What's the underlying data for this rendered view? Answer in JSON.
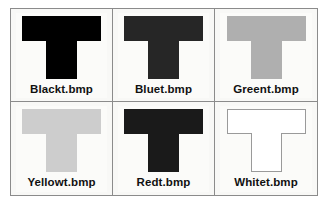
{
  "figure": {
    "background": "#ffffff",
    "frame_color": "#8b8b8b",
    "panel_background": "#fbfbf9",
    "label_color": "#111111",
    "columns": 3,
    "rows": 2
  },
  "panels": [
    {
      "label": "Blackt.bmp",
      "shape": "T",
      "fill": "#000000",
      "outline": false,
      "position": "row-1-col-1"
    },
    {
      "label": "Bluet.bmp",
      "shape": "T",
      "fill": "#262626",
      "outline": false,
      "position": "row-1-col-2"
    },
    {
      "label": "Greent.bmp",
      "shape": "T",
      "fill": "#afafaf",
      "outline": false,
      "position": "row-1-col-3"
    },
    {
      "label": "Yellowt.bmp",
      "shape": "T",
      "fill": "#cdcdcd",
      "outline": false,
      "position": "row-2-col-1"
    },
    {
      "label": "Redt.bmp",
      "shape": "T",
      "fill": "#1a1a1a",
      "outline": false,
      "position": "row-2-col-2"
    },
    {
      "label": "Whitet.bmp",
      "shape": "T",
      "fill": "#ffffff",
      "outline": true,
      "outline_color": "#9a9a9a",
      "position": "row-2-col-3"
    }
  ]
}
